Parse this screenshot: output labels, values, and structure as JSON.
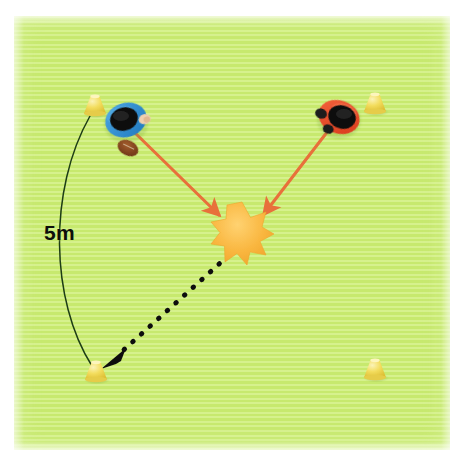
{
  "scene": {
    "title": "Two-player rugby passing drill on grass pitch",
    "surface": "grass-pitch",
    "colors": {
      "grass_light": "#d6f18d",
      "grass_dark": "#c7e96e",
      "cone_yellow": "#f0d84c",
      "cone_yellow_light": "#f7ea9a",
      "arrow_orange": "#e8703a",
      "star_orange": "#f7b13c",
      "dotted_black": "#111111",
      "measure_line": "#1d3d14",
      "shirt_blue": "#2e8fd4",
      "shirt_red": "#ec4e2c",
      "hair_black": "#111111",
      "ball_brown": "#8a4a22",
      "page_background": "#ffffff"
    }
  },
  "annotations": {
    "distance_label": "5m",
    "distance_label_name": "distance-measurement-5m"
  },
  "cones": [
    {
      "id": "cone-top-left",
      "x": 95,
      "y": 105,
      "label": "cone"
    },
    {
      "id": "cone-top-right",
      "x": 375,
      "y": 103,
      "label": "cone"
    },
    {
      "id": "cone-bottom-left",
      "x": 96,
      "y": 371,
      "label": "cone"
    },
    {
      "id": "cone-bottom-right",
      "x": 375,
      "y": 369,
      "label": "cone"
    }
  ],
  "players": [
    {
      "id": "player-left-blue",
      "shirt": "blue",
      "x": 126,
      "y": 120,
      "rotation": -18,
      "has_ball": true,
      "ball": "rugby-ball"
    },
    {
      "id": "player-right-red",
      "shirt": "red",
      "x": 339,
      "y": 117,
      "rotation": 20,
      "has_ball": false,
      "ball": null
    }
  ],
  "markers": [
    {
      "id": "contact-burst",
      "type": "star-burst",
      "x": 242,
      "y": 232,
      "radius": 28,
      "points": 9
    }
  ],
  "arrows": [
    {
      "id": "run-arrow-left",
      "style": "solid",
      "color": "#e8703a",
      "from": {
        "x": 131,
        "y": 129
      },
      "to": {
        "x": 219,
        "y": 215
      },
      "label": "left player runs to contact point"
    },
    {
      "id": "run-arrow-right",
      "style": "solid",
      "color": "#e8703a",
      "from": {
        "x": 331,
        "y": 127
      },
      "to": {
        "x": 264,
        "y": 214
      },
      "label": "right player runs to contact point"
    },
    {
      "id": "pass-arrow-dotted",
      "style": "dotted",
      "color": "#111111",
      "from": {
        "x": 228,
        "y": 256
      },
      "to": {
        "x": 106,
        "y": 366
      },
      "label": "pass / movement back to bottom-left cone"
    }
  ],
  "measurement": {
    "id": "measure-arc-5m",
    "style": "thin-curved-line",
    "color": "#1d3d14",
    "from": {
      "x": 90,
      "y": 116
    },
    "to": {
      "x": 92,
      "y": 366
    },
    "bow_x": 48,
    "text": "5m"
  }
}
